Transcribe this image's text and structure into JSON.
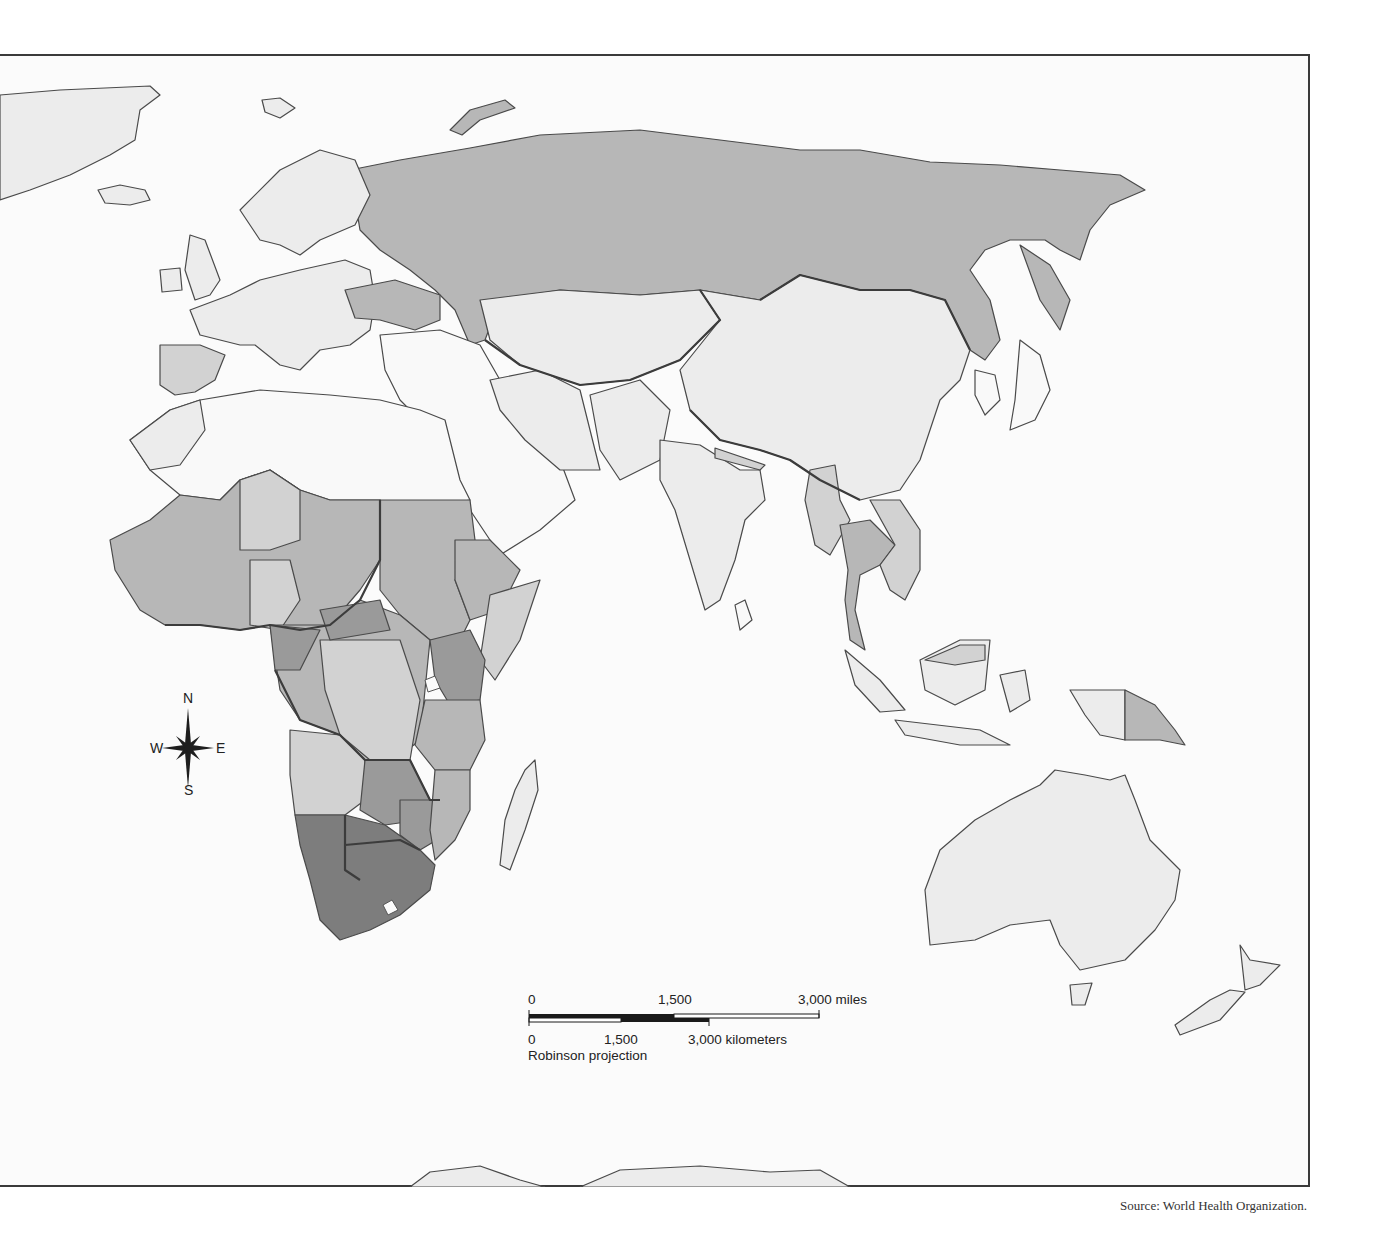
{
  "map": {
    "projection_label": "Robinson projection",
    "source": "Source: World Health Organization.",
    "compass": {
      "n": "N",
      "s": "S",
      "e": "E",
      "w": "W"
    },
    "scale_bar": {
      "miles": {
        "ticks": [
          "0",
          "1,500",
          "3,000 miles"
        ]
      },
      "kilometers": {
        "ticks": [
          "0",
          "1,500",
          "3,000 kilometers"
        ]
      }
    },
    "shade_classes": [
      {
        "class": "c0",
        "fill": "#f9f9f9",
        "meaning": "lowest / no data"
      },
      {
        "class": "c1",
        "fill": "#ececec"
      },
      {
        "class": "c2",
        "fill": "#d2d2d2"
      },
      {
        "class": "c3",
        "fill": "#b7b7b7"
      },
      {
        "class": "c4",
        "fill": "#9a9a9a"
      },
      {
        "class": "c5",
        "fill": "#7d7d7d",
        "meaning": "highest"
      }
    ],
    "regions": [
      {
        "name": "Russia",
        "shade": "c3"
      },
      {
        "name": "Ukraine",
        "shade": "c3"
      },
      {
        "name": "Western Europe",
        "shade": "c1"
      },
      {
        "name": "Spain",
        "shade": "c2"
      },
      {
        "name": "North Africa",
        "shade": "c0"
      },
      {
        "name": "Middle East",
        "shade": "c0"
      },
      {
        "name": "Central Asia",
        "shade": "c1"
      },
      {
        "name": "China & Mongolia",
        "shade": "c1"
      },
      {
        "name": "India",
        "shade": "c1"
      },
      {
        "name": "Southeast Asia",
        "shade": "c2"
      },
      {
        "name": "Thailand",
        "shade": "c3"
      },
      {
        "name": "West Africa",
        "shade": "c3"
      },
      {
        "name": "Central Africa",
        "shade": "c3"
      },
      {
        "name": "East Africa",
        "shade": "c3"
      },
      {
        "name": "Southern Africa",
        "shade": "c5"
      },
      {
        "name": "Madagascar",
        "shade": "c1"
      },
      {
        "name": "Indonesia",
        "shade": "c1"
      },
      {
        "name": "Papua New Guinea",
        "shade": "c3"
      },
      {
        "name": "Australia",
        "shade": "c1"
      },
      {
        "name": "New Zealand",
        "shade": "c1"
      },
      {
        "name": "Antarctica",
        "shade": "c1"
      },
      {
        "name": "Greenland",
        "shade": "c1"
      }
    ]
  }
}
